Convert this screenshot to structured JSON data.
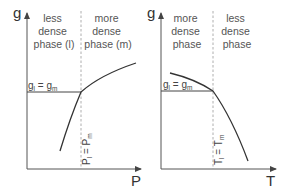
{
  "colors": {
    "axis": "#555555",
    "curve": "#333333",
    "dashed": "#999999",
    "text": "#555555"
  },
  "panels": [
    {
      "id": "pressure",
      "y_axis_label": "g",
      "x_axis_label": "P",
      "left_region": [
        "less",
        "dense",
        "phase (l)"
      ],
      "right_region": [
        "more",
        "dense",
        "phase (m)"
      ],
      "equality_label": "g_l = g_m",
      "equality_label_base": "g",
      "equality_label_sub1": "l",
      "equality_label_mid": " = g",
      "equality_label_sub2": "m",
      "transition_label_base1": "P",
      "transition_label_sub1": "l",
      "transition_label_mid": " = P",
      "transition_label_sub2": "m"
    },
    {
      "id": "temperature",
      "y_axis_label": "g",
      "x_axis_label": "T",
      "left_region": [
        "more",
        "dense",
        "phase"
      ],
      "right_region": [
        "less",
        "dense",
        "phase"
      ],
      "equality_label": "g_l = g_m",
      "equality_label_base": "g",
      "equality_label_sub1": "l",
      "equality_label_mid": " = g",
      "equality_label_sub2": "m",
      "transition_label_base1": "T",
      "transition_label_sub1": "l",
      "transition_label_mid": " = T",
      "transition_label_sub2": "m"
    }
  ]
}
